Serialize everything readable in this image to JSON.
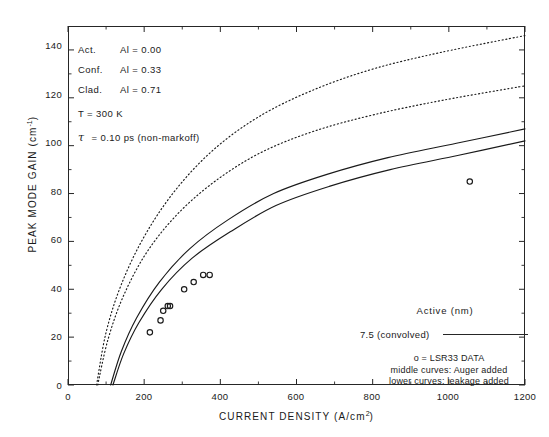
{
  "chart_data": {
    "type": "line",
    "title": "",
    "xlabel": "CURRENT DENSITY (A/cm²)",
    "ylabel": "PEAK MODE GAIN (cm⁻¹)",
    "xlim": [
      0,
      1200
    ],
    "ylim": [
      0,
      150
    ],
    "xticks": [
      0,
      200,
      400,
      600,
      800,
      1000,
      1200
    ],
    "yticks": [
      0,
      20,
      40,
      60,
      80,
      100,
      120,
      140
    ],
    "grid": false,
    "legend_position": "bottom-right",
    "series": [
      {
        "name": "upper curve (dotted) - radiative only",
        "style": "dotted",
        "x": [
          75,
          100,
          140,
          200,
          280,
          380,
          500,
          640,
          800,
          980,
          1200
        ],
        "y": [
          0,
          22,
          42,
          62,
          81,
          98,
          112,
          123,
          132,
          139,
          146
        ]
      },
      {
        "name": "middle curve (dotted) - Auger added",
        "style": "dotted",
        "x": [
          78,
          105,
          145,
          205,
          285,
          385,
          505,
          645,
          805,
          985,
          1200
        ],
        "y": [
          0,
          19,
          37,
          55,
          71,
          85,
          97,
          106,
          113,
          119,
          125
        ]
      },
      {
        "name": "upper solid curve - Auger added",
        "style": "solid",
        "x": [
          112,
          140,
          180,
          240,
          320,
          420,
          540,
          680,
          840,
          1020,
          1200
        ],
        "y": [
          0,
          14,
          28,
          43,
          57,
          69,
          80,
          88,
          95,
          101,
          107
        ]
      },
      {
        "name": "lower solid curve - leakage added",
        "style": "solid",
        "x": [
          118,
          146,
          186,
          246,
          326,
          426,
          546,
          686,
          846,
          1026,
          1200
        ],
        "y": [
          0,
          13,
          26,
          40,
          53,
          64,
          75,
          83,
          90,
          96,
          102
        ]
      }
    ],
    "scatter": {
      "name": "LSR33 DATA",
      "marker": "open-circle",
      "points": [
        {
          "x": 215,
          "y": 22
        },
        {
          "x": 243,
          "y": 27
        },
        {
          "x": 250,
          "y": 31
        },
        {
          "x": 262,
          "y": 33
        },
        {
          "x": 268,
          "y": 33
        },
        {
          "x": 305,
          "y": 40
        },
        {
          "x": 330,
          "y": 43
        },
        {
          "x": 355,
          "y": 46
        },
        {
          "x": 372,
          "y": 46
        },
        {
          "x": 1055,
          "y": 85
        }
      ]
    },
    "annotations": [
      {
        "label": "Act.",
        "symbol": "Al",
        "eq": "=",
        "value": "0.00"
      },
      {
        "label": "Conf.",
        "symbol": "Al",
        "eq": "=",
        "value": "0.33"
      },
      {
        "label": "Clad.",
        "symbol": "Al",
        "eq": "=",
        "value": "0.71"
      }
    ],
    "temperature_line": "T = 300 K",
    "tau_line": "= 0.10 ps (non-markoff)",
    "tau_symbol": "τ"
  },
  "axes": {
    "ylabel_main": "PEAK MODE GAIN (cm",
    "ylabel_sup": "-1",
    "ylabel_close": ")",
    "xlabel_main": "CURRENT DENSITY (A/cm",
    "xlabel_sup": "2",
    "xlabel_close": ")",
    "yticks": [
      "0",
      "20",
      "40",
      "60",
      "80",
      "100",
      "120",
      "140"
    ],
    "xticks": [
      "0",
      "200",
      "400",
      "600",
      "800",
      "1000",
      "1200"
    ]
  },
  "annotations": {
    "rows": [
      {
        "label": "Act.",
        "text": "Al  =  0.00",
        "symbol": "Al",
        "value": "0.00"
      },
      {
        "label": "Conf.",
        "text": "Al  =  0.33",
        "symbol": "Al",
        "value": "0.33"
      },
      {
        "label": "Clad.",
        "text": "Al  =  0.71",
        "symbol": "Al",
        "value": "0.71"
      }
    ],
    "temperature": "T  =  300  K",
    "tau_symbol": "τ",
    "tau_text": "=  0.10  ps  (non-markoff)"
  },
  "legend": {
    "header": "Active  (nm)",
    "entry_label": "7.5  (convolved)",
    "data_note": "o  =  LSR33  DATA",
    "middle_note": "middle  curves:  Auger     added",
    "lower_note": "lower   curves:  leakage  added"
  },
  "colors": {
    "axis": "#262626",
    "curve": "#1a1a1a",
    "marker": "#1a1a1a",
    "background": "#ffffff"
  }
}
